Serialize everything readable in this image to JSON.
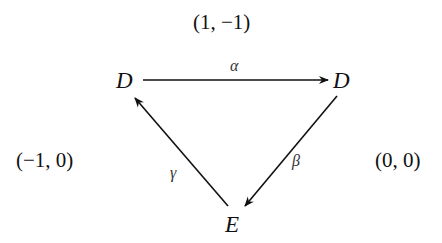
{
  "diagram": {
    "type": "commutative-triangle",
    "nodes": [
      {
        "id": "D1",
        "label": "D",
        "position": "top-left"
      },
      {
        "id": "D2",
        "label": "D",
        "position": "top-right"
      },
      {
        "id": "E",
        "label": "E",
        "position": "bottom"
      }
    ],
    "edges": [
      {
        "from": "D1",
        "to": "D2",
        "label": "α"
      },
      {
        "from": "D2",
        "to": "E",
        "label": "β"
      },
      {
        "from": "E",
        "to": "D1",
        "label": "γ"
      }
    ],
    "annotations": {
      "top": "(1, −1)",
      "left": "(−1, 0)",
      "right": "(0, 0)"
    }
  }
}
